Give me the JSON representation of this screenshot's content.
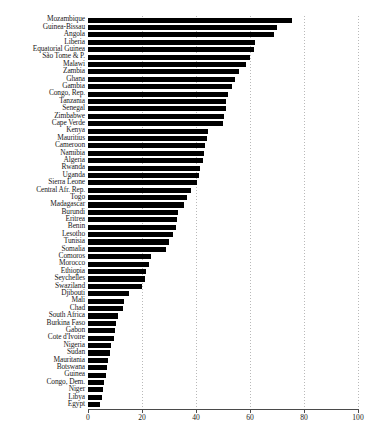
{
  "chart_data": {
    "type": "bar",
    "orientation": "horizontal",
    "title": "",
    "subtitle": "",
    "xlabel": "",
    "ylabel": "",
    "xlim": [
      0,
      100
    ],
    "xticks": [
      0,
      20,
      40,
      60,
      80,
      100
    ],
    "xtick_labels": [
      "0",
      "20",
      "40",
      "60",
      "80",
      "100"
    ],
    "grid": true,
    "grid_axis": "x",
    "legend": null,
    "bar_color": "#000000",
    "categories": [
      "Mozambique",
      "Guinea-Bissau",
      "Angola",
      "Liberia",
      "Equatorial Guinea",
      "São Tome & P.",
      "Malawi",
      "Zambia",
      "Ghana",
      "Gambia",
      "Congo, Rep.",
      "Tanzania",
      "Senegal",
      "Zimbabwe",
      "Cape Verde",
      "Kenya",
      "Mauritius",
      "Cameroon",
      "Namibia",
      "Algeria",
      "Rwanda",
      "Uganda",
      "Sierra Leone",
      "Central Afr. Rep.",
      "Togo",
      "Madagascar",
      "Burundi",
      "Eritrea",
      "Benin",
      "Lesotho",
      "Tunisia",
      "Somalia",
      "Comoros",
      "Morocco",
      "Ethiopia",
      "Seychelles",
      "Swaziland",
      "Djibouti",
      "Mali",
      "Chad",
      "South Africa",
      "Burkina Faso",
      "Gabon",
      "Cote d'Ivoire",
      "Nigeria",
      "Sudan",
      "Mauritania",
      "Botswana",
      "Guinea",
      "Congo, Dem.",
      "Niger",
      "Libya",
      "Egypt"
    ],
    "values": [
      75.5,
      70.0,
      69.0,
      62.0,
      61.5,
      60.0,
      58.5,
      56.0,
      54.5,
      53.5,
      52.0,
      51.0,
      51.0,
      50.5,
      50.0,
      44.5,
      44.0,
      43.5,
      43.0,
      42.5,
      41.5,
      41.0,
      40.5,
      38.0,
      36.5,
      35.5,
      33.5,
      33.0,
      32.5,
      31.5,
      30.0,
      29.0,
      23.5,
      22.5,
      21.5,
      21.0,
      20.0,
      15.0,
      13.5,
      13.0,
      11.0,
      10.5,
      10.0,
      9.5,
      8.5,
      8.0,
      7.5,
      7.0,
      6.5,
      6.0,
      5.5,
      5.0,
      4.5
    ]
  }
}
